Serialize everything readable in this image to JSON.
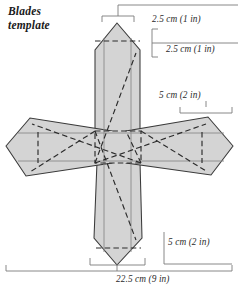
{
  "title": {
    "line1": "Blades",
    "line2": "template"
  },
  "colors": {
    "fill": "#d4d4d4",
    "stroke": "#3a3a3a",
    "dashed": "#2b2b2b",
    "inner_line": "#8a8a8a",
    "dimension": "#7a7a7a",
    "text": "#2b2b2b",
    "background": "#ffffff"
  },
  "dimensions": {
    "top_width": "2.5 cm (1 in)",
    "top_height": "2.5 cm (1 in)",
    "arm_width": "5 cm (2 in)",
    "blade_length": "5 cm (2 in)",
    "total_width": "22.5 cm (9 in)"
  },
  "diagram": {
    "type": "cross-shaped-blades-template",
    "shape": "four-bladed cross with pointed hexagonal blades",
    "hub": "central dashed square fold hub",
    "fold_lines": "dashed diagonal and square fold lines",
    "blades": [
      "top-blade",
      "left-blade",
      "right-blade",
      "bottom-blade"
    ]
  }
}
